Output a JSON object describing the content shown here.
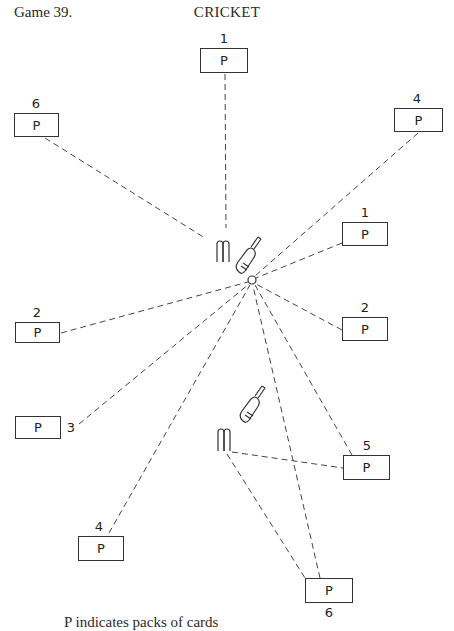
{
  "header": {
    "game_label": "Game 39.",
    "title": "CRICKET"
  },
  "caption": "P indicates packs of cards",
  "pack_symbol": "P",
  "ball": {
    "x": 252,
    "y": 280
  },
  "wickets": [
    {
      "name": "batting-end",
      "x": 221,
      "y": 240
    },
    {
      "name": "bowling-end",
      "x": 223,
      "y": 428
    }
  ],
  "packs": [
    {
      "id": "top-1",
      "number": "1",
      "x": 200,
      "y": 48,
      "w": 48,
      "h": 25,
      "label_pos": "above",
      "line_to": [
        225,
        73
      ]
    },
    {
      "id": "top-left-6",
      "number": "6",
      "x": 14,
      "y": 113,
      "w": 45,
      "h": 24,
      "label_pos": "above",
      "line_to": [
        45,
        137
      ]
    },
    {
      "id": "top-right-4",
      "number": "4",
      "x": 394,
      "y": 108,
      "w": 49,
      "h": 24,
      "label_pos": "above",
      "line_to": [
        418,
        132
      ]
    },
    {
      "id": "right-1",
      "number": "1",
      "x": 342,
      "y": 222,
      "w": 46,
      "h": 24,
      "label_pos": "above",
      "line_to": [
        342,
        243
      ]
    },
    {
      "id": "right-2",
      "number": "2",
      "x": 342,
      "y": 317,
      "w": 46,
      "h": 24,
      "label_pos": "above",
      "line_to": [
        342,
        330
      ]
    },
    {
      "id": "left-2",
      "number": "2",
      "x": 15,
      "y": 322,
      "w": 45,
      "h": 21,
      "label_pos": "above",
      "line_to": [
        60,
        333
      ]
    },
    {
      "id": "left-3",
      "number": "3",
      "x": 15,
      "y": 416,
      "w": 46,
      "h": 23,
      "label_pos": "right",
      "line_to": [
        78,
        424
      ]
    },
    {
      "id": "right-5",
      "number": "5",
      "x": 343,
      "y": 455,
      "w": 47,
      "h": 25,
      "label_pos": "above",
      "line_to": [
        352,
        455
      ]
    },
    {
      "id": "bottom-left-4",
      "number": "4",
      "x": 78,
      "y": 536,
      "w": 46,
      "h": 25,
      "label_pos": "above",
      "line_to": [
        108,
        534
      ]
    },
    {
      "id": "bottom-6",
      "number": "6",
      "x": 305,
      "y": 578,
      "w": 48,
      "h": 25,
      "label_pos": "below",
      "line_to": [
        320,
        578
      ]
    }
  ],
  "lines_from_bowling_wicket": [
    {
      "to": "right-5",
      "end": [
        343,
        468
      ]
    },
    {
      "to": "bottom-6",
      "end": [
        305,
        578
      ]
    }
  ]
}
